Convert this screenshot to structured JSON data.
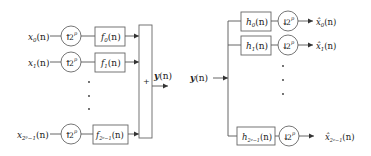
{
  "synthesis_bank": {
    "inputs": [
      {
        "base": "x",
        "sub": "0",
        "arg": "(n)"
      },
      {
        "base": "x",
        "sub": "1",
        "arg": "(n)"
      },
      {
        "base": "x",
        "sub": "2ᵖ−1",
        "arg": "(n)"
      }
    ],
    "upsampler_label": {
      "arrow": "↑",
      "base": "2",
      "exp": "p"
    },
    "filters": [
      {
        "base": "f",
        "sub": "0",
        "arg": "(n)"
      },
      {
        "base": "f",
        "sub": "1",
        "arg": "(n)"
      },
      {
        "base": "f",
        "sub": "2ᵖ−1",
        "arg": "(n)"
      }
    ],
    "sum_symbol": "+",
    "output": {
      "base": "y",
      "arg": "(n)"
    },
    "ellipsis": "⋮"
  },
  "analysis_bank": {
    "input": {
      "base": "y",
      "arg": "(n)"
    },
    "filters": [
      {
        "base": "h",
        "sub": "0",
        "arg": "(n)"
      },
      {
        "base": "h",
        "sub": "1",
        "arg": "(n)"
      },
      {
        "base": "h",
        "sub": "2ᵖ−1",
        "arg": "(n)"
      }
    ],
    "downsampler_label": {
      "arrow": "↓",
      "base": "2",
      "exp": "p"
    },
    "outputs": [
      {
        "base": "x̂",
        "sub": "0",
        "arg": "(n)"
      },
      {
        "base": "x̂",
        "sub": "1",
        "arg": "(n)"
      },
      {
        "base": "x̂",
        "sub": "2ᵖ−1",
        "arg": "(n)"
      }
    ],
    "ellipsis": "⋮"
  },
  "colors": {
    "line": "#555555",
    "text": "#222222",
    "background": "#ffffff"
  }
}
